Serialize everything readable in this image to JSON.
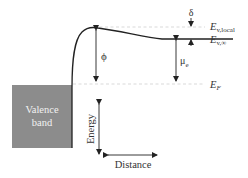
{
  "diagram": {
    "valence_band_label": [
      "Valence",
      "band"
    ],
    "levels": {
      "e_v_local": {
        "symbol": "E",
        "subscript": "v,local"
      },
      "e_v_inf": {
        "symbol": "E",
        "subscript": "v,∞"
      },
      "e_f": {
        "symbol": "E",
        "subscript": "F"
      }
    },
    "quantities": {
      "phi": "ϕ",
      "mu": "μ",
      "mu_subscript": "e",
      "delta": "δ"
    },
    "axes": {
      "energy_label": "Energy",
      "distance_label": "Distance"
    },
    "colors": {
      "valence_band_fill": "#8c8c8c",
      "curve": "#222222",
      "dashed": "#c8c8c8",
      "arrow": "#222222"
    }
  }
}
